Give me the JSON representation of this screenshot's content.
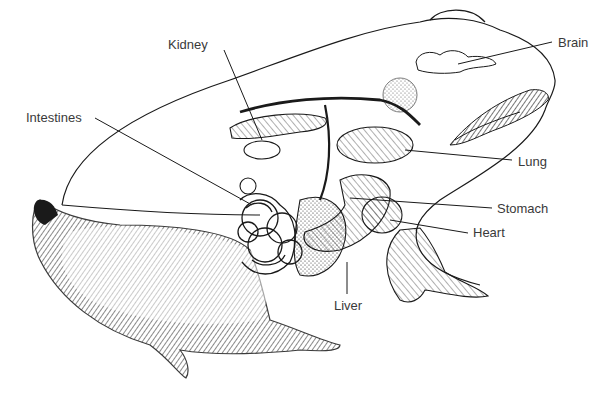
{
  "diagram": {
    "colors": {
      "ink": "#1a1a1a",
      "label": "#3a3a3a",
      "background": "#ffffff"
    },
    "labels": [
      {
        "id": "kidney",
        "text": "Kidney",
        "x": 168,
        "y": 38
      },
      {
        "id": "brain",
        "text": "Brain",
        "x": 558,
        "y": 36
      },
      {
        "id": "intestines",
        "text": "Intestines",
        "x": 26,
        "y": 111
      },
      {
        "id": "lung",
        "text": "Lung",
        "x": 518,
        "y": 155
      },
      {
        "id": "stomach",
        "text": "Stomach",
        "x": 497,
        "y": 202
      },
      {
        "id": "heart",
        "text": "Heart",
        "x": 473,
        "y": 226
      },
      {
        "id": "liver",
        "text": "Liver",
        "x": 334,
        "y": 299
      }
    ]
  }
}
